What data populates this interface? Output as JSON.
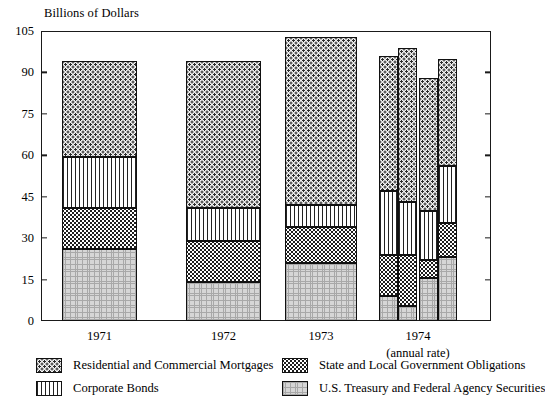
{
  "chart_data": {
    "type": "bar",
    "title": "",
    "ylabel": "Billions of Dollars",
    "xlabel": "",
    "ylim": [
      0,
      105
    ],
    "yticks": [
      0,
      15,
      30,
      45,
      60,
      75,
      90,
      105
    ],
    "grid": false,
    "stacked": true,
    "legend_position": "bottom",
    "categories": [
      "1971",
      "1972",
      "1973",
      "1974 Q1",
      "1974 Q2",
      "1974 Q3",
      "1974 Q4"
    ],
    "group_labels": [
      "1971",
      "1972",
      "1973",
      "1974"
    ],
    "group_sublabel": "(annual rate)",
    "series": [
      {
        "name": "U.S. Treasury and Federal Agency Securities",
        "key": "treasury",
        "pattern": "fine-grid-light-gray",
        "values": [
          26.0,
          14.0,
          21.0,
          9.0,
          5.5,
          15.5,
          23.0
        ]
      },
      {
        "name": "State and Local Government Obligations",
        "key": "state_local",
        "pattern": "dense-dark-checker",
        "values": [
          15.0,
          15.0,
          13.0,
          15.0,
          18.5,
          6.5,
          12.5
        ]
      },
      {
        "name": "Corporate Bonds",
        "key": "corporate",
        "pattern": "vertical-lines",
        "values": [
          18.5,
          12.0,
          8.0,
          23.0,
          19.0,
          18.0,
          20.5
        ]
      },
      {
        "name": "Residential and Commercial Mortgages",
        "key": "mortgages",
        "pattern": "sparse-dots",
        "values": [
          34.5,
          53.0,
          61.0,
          49.0,
          56.0,
          48.0,
          39.0
        ]
      }
    ],
    "totals": [
      94.0,
      94.0,
      103.0,
      96.0,
      99.0,
      88.0,
      95.0
    ]
  },
  "axis": {
    "y_title": "Billions of Dollars",
    "ticks": [
      "105",
      "90",
      "75",
      "60",
      "45",
      "30",
      "15",
      "0"
    ]
  },
  "xaxis": {
    "labels": [
      "1971",
      "1972",
      "1973",
      "1974"
    ],
    "sublabel": "(annual rate)"
  },
  "legend": {
    "items": [
      {
        "label": "Residential and Commercial Mortgages",
        "swatch": "sparse-dots-swatch"
      },
      {
        "label": "State and Local Government Obligations",
        "swatch": "dense-dark-checker-swatch"
      },
      {
        "label": "Corporate Bonds",
        "swatch": "vertical-lines-swatch"
      },
      {
        "label": "U.S. Treasury and Federal Agency Securities",
        "swatch": "fine-grid-light-gray-swatch"
      }
    ]
  },
  "colors": {
    "axis": "#1a1a1a",
    "mortgages_fill": "#f2f2f2",
    "corporate_fill": "#ffffff",
    "state_local_fill": "#1e1e1e",
    "treasury_fill": "#d6d6d6"
  }
}
